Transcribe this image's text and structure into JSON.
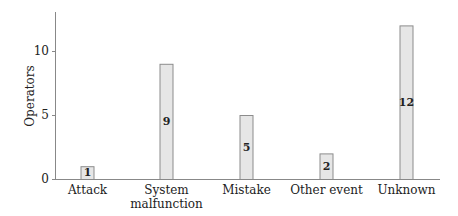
{
  "chart_data": {
    "type": "bar",
    "title": "",
    "xlabel": "",
    "ylabel": "Operators",
    "categories": [
      "Attack",
      "System malfunction",
      "Mistake",
      "Other event",
      "Unknown"
    ],
    "category_lines": [
      [
        "Attack"
      ],
      [
        "System",
        "malfunction"
      ],
      [
        "Mistake"
      ],
      [
        "Other event"
      ],
      [
        "Unknown"
      ]
    ],
    "values": [
      1,
      9,
      5,
      2,
      12
    ],
    "value_labels": [
      "1",
      "9",
      "5",
      "2",
      "12"
    ],
    "ylim": [
      0,
      13
    ],
    "yticks": [
      0,
      5,
      10
    ],
    "ytick_labels": [
      "0",
      "5",
      "10"
    ],
    "grid": false,
    "legend": null,
    "bar_fill": "#e6e6e6",
    "bar_stroke": "#8c8c8c"
  }
}
